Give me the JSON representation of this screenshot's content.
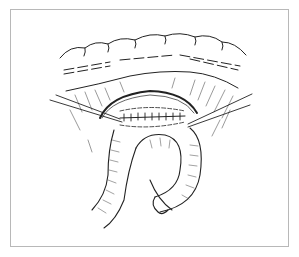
{
  "figure": {
    "frame_color": "#b8b8b8",
    "line_color": "#222222",
    "labels": []
  }
}
